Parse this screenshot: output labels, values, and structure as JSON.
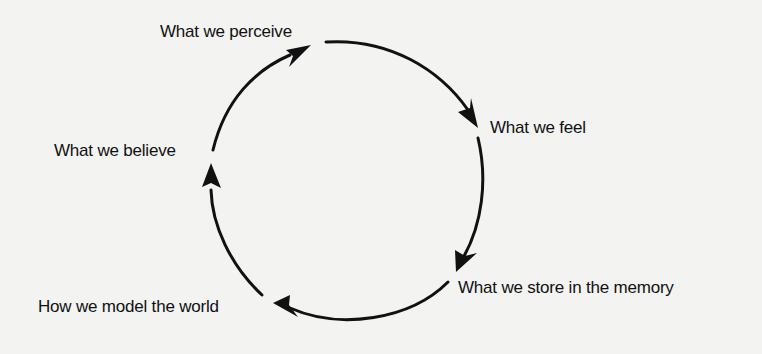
{
  "diagram": {
    "type": "cycle",
    "direction": "clockwise",
    "nodes": [
      {
        "id": "perceive",
        "label": "What we perceive"
      },
      {
        "id": "feel",
        "label": "What we feel"
      },
      {
        "id": "store",
        "label": "What we store in the memory"
      },
      {
        "id": "model",
        "label": "How we model the world"
      },
      {
        "id": "believe",
        "label": "What we believe"
      }
    ],
    "edges": [
      {
        "from": "perceive",
        "to": "feel"
      },
      {
        "from": "feel",
        "to": "store"
      },
      {
        "from": "store",
        "to": "model"
      },
      {
        "from": "model",
        "to": "believe"
      },
      {
        "from": "believe",
        "to": "perceive"
      }
    ],
    "colors": {
      "background": "#f3f3f2",
      "stroke": "#111111"
    }
  }
}
